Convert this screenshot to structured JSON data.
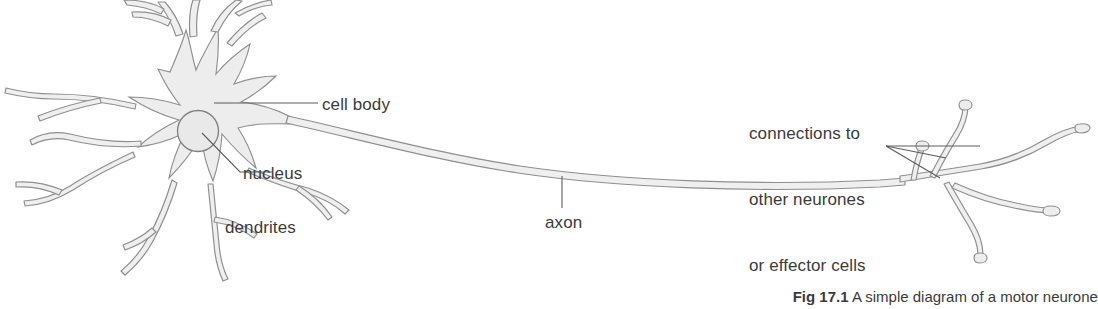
{
  "figure": {
    "background_color": "#ffffff",
    "stroke_color": "#8a8a8a",
    "fill_color": "#ededed",
    "text_color": "#3b3b3b"
  },
  "labels": {
    "cell_body": "cell body",
    "nucleus": "nucleus",
    "dendrites": "dendrites",
    "axon": "axon",
    "connections_line1": "connections to",
    "connections_line2": "other neurones",
    "connections_line3": "or effector cells"
  },
  "caption": {
    "number": "Fig 17.1",
    "text": "A simple diagram of a motor neurone"
  }
}
